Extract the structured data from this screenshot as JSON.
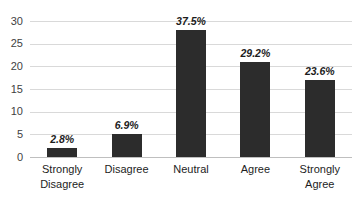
{
  "chart_data": {
    "type": "bar",
    "title": "",
    "xlabel": "",
    "ylabel": "",
    "ylim": [
      0,
      30
    ],
    "yticks": [
      "0",
      "5",
      "10",
      "15",
      "20",
      "25",
      "30"
    ],
    "grid": true,
    "legend": false,
    "bar_color": "#2c2c2c",
    "gridline_color": "#d9d9d9",
    "categories": [
      "Strongly Disagree",
      "Disagree",
      "Neutral",
      "Agree",
      "Strongly Agree"
    ],
    "category_lines": [
      [
        "Strongly",
        "Disagree"
      ],
      [
        "Disagree",
        ""
      ],
      [
        "Neutral",
        ""
      ],
      [
        "Agree",
        ""
      ],
      [
        "Strongly",
        "Agree"
      ]
    ],
    "values": [
      2,
      5,
      28,
      21,
      17
    ],
    "data_labels": [
      "2.8%",
      "6.9%",
      "37.5%",
      "29.2%",
      "23.6%"
    ],
    "percentages": [
      2.8,
      6.9,
      37.5,
      29.2,
      23.6
    ]
  }
}
